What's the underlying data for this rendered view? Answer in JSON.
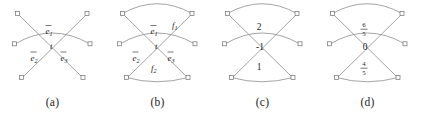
{
  "figure": {
    "panel_count": 4,
    "node_count_per_panel": 6,
    "stroke_color": "#8d8d8d",
    "label_color": "#1f1f1f",
    "background": "#ffffff"
  },
  "panels": [
    {
      "id": "panel-a",
      "caption": "(a)",
      "labels": {
        "arc_top": "e",
        "arc_top_sub": "1",
        "center": "t",
        "left": "e",
        "left_sub": "2",
        "right": "e",
        "right_sub": "3"
      }
    },
    {
      "id": "panel-b",
      "caption": "(b)",
      "labels": {
        "outer_top": "f",
        "outer_top_sub": "1",
        "arc_top": "e",
        "arc_top_sub": "1",
        "center": "t",
        "left": "e",
        "left_sub": "2",
        "right": "e",
        "right_sub": "3",
        "outer_bottom": "f",
        "outer_bottom_sub": "2"
      }
    },
    {
      "id": "panel-c",
      "caption": "(c)",
      "labels": {
        "top": "2",
        "center": "-1",
        "bottom": "1"
      }
    },
    {
      "id": "panel-d",
      "caption": "(d)",
      "labels": {
        "top_numerator": "6",
        "top_denominator": "5",
        "center": "0",
        "bottom_numerator": "4",
        "bottom_denominator": "5"
      }
    }
  ]
}
